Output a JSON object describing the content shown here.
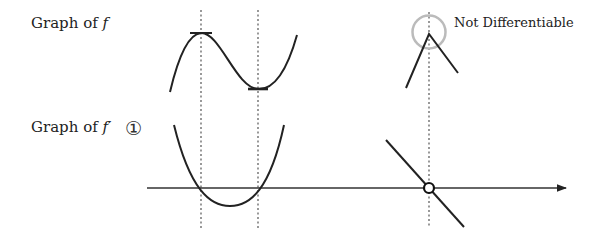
{
  "labels": {
    "f_graph": {
      "prefix": "Graph of ",
      "symbol": "f"
    },
    "f_prime_graph": {
      "prefix": "Graph of ",
      "symbol": "f′"
    },
    "marker": "①",
    "not_differentiable": "Not Differentiable"
  },
  "colors": {
    "curve": "#222222",
    "guide": "#555555",
    "highlight_circle": "#bbbbbb",
    "background": "#ffffff"
  },
  "diagram": {
    "f_graph": {
      "description": "cubic-like curve with local max and local min, horizontal tangents at extrema",
      "local_max": {
        "x": 201,
        "y": 33
      },
      "local_min": {
        "x": 258,
        "y": 89
      },
      "corner_point": {
        "x": 429,
        "y": 34,
        "note": "Not Differentiable"
      }
    },
    "f_prime_graph": {
      "description": "upward parabola crossing x-axis at extrema locations; descending line with open circle at corner location",
      "x_axis_y": 188,
      "roots": [
        201,
        258
      ],
      "vertex": {
        "x": 230,
        "y": 206
      },
      "open_point": {
        "x": 429,
        "y": 188
      }
    }
  }
}
